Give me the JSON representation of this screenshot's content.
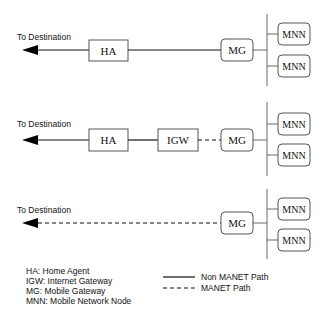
{
  "diagram": {
    "rows": [
      {
        "destination_label": "To Destination",
        "nodes": {
          "ha": "HA",
          "mg": "MG"
        },
        "path": "solid",
        "mnn": [
          "MNN",
          "MNN"
        ]
      },
      {
        "destination_label": "To Destination",
        "nodes": {
          "ha": "HA",
          "igw": "IGW",
          "mg": "MG"
        },
        "paths": {
          "dest_ha": "solid",
          "ha_igw": "solid",
          "igw_mg": "dashed"
        },
        "mnn": [
          "MNN",
          "MNN"
        ]
      },
      {
        "destination_label": "To Destination",
        "nodes": {
          "mg": "MG"
        },
        "path": "dashed",
        "mnn": [
          "MNN",
          "MNN"
        ]
      }
    ],
    "abbreviations": [
      "HA: Home Agent",
      "IGW: Internet Gateway",
      "MG: Mobile Gateway",
      "MNN: Mobile Network Node"
    ],
    "line_legend": {
      "solid": "Non MANET Path",
      "dashed": "MANET Path"
    }
  }
}
